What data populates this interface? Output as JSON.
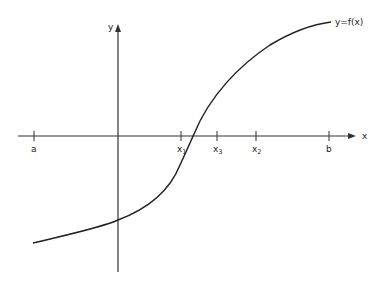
{
  "figure": {
    "type": "function graph diagram",
    "curve_label": "y=f(x)",
    "x_axis_label": "x",
    "y_axis_label": "y",
    "ticks": [
      {
        "name": "a",
        "label": "a",
        "sub": ""
      },
      {
        "name": "x1",
        "label": "x",
        "sub": "1"
      },
      {
        "name": "x3",
        "label": "x",
        "sub": "3"
      },
      {
        "name": "x2",
        "label": "x",
        "sub": "2"
      },
      {
        "name": "b",
        "label": "b",
        "sub": ""
      }
    ],
    "colors": {
      "line": "#222222",
      "background": "#ffffff"
    }
  }
}
